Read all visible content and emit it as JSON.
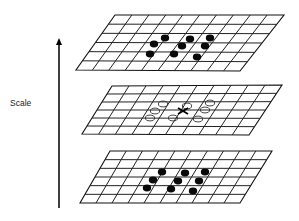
{
  "diagram": {
    "axis": {
      "label": "Scale",
      "direction": "up",
      "x": 59,
      "y_tail": 208,
      "y_tip": 38,
      "label_x": 10,
      "label_y": 106
    },
    "layers": [
      {
        "id": "upper-scale",
        "corners": {
          "tl": [
            115,
            15
          ],
          "tr": [
            284,
            15
          ],
          "br": [
            240,
            71
          ],
          "bl": [
            76,
            70
          ]
        },
        "rows": 6,
        "cols": 10,
        "marker_style": "filled",
        "markers": [
          [
            165,
            38
          ],
          [
            190,
            39
          ],
          [
            210,
            38
          ],
          [
            154,
            44
          ],
          [
            182,
            46
          ],
          [
            205,
            46
          ],
          [
            150,
            54
          ],
          [
            174,
            54
          ],
          [
            197,
            57
          ]
        ]
      },
      {
        "id": "current-scale",
        "corners": {
          "tl": [
            112,
            86
          ],
          "tr": [
            282,
            85
          ],
          "br": [
            249,
            135
          ],
          "bl": [
            82,
            134
          ]
        },
        "rows": 6,
        "cols": 10,
        "marker_style": "open",
        "markers": [
          [
            163,
            104
          ],
          [
            187,
            106
          ],
          [
            210,
            103
          ],
          [
            155,
            111
          ],
          [
            205,
            110
          ],
          [
            150,
            118
          ],
          [
            173,
            118
          ],
          [
            198,
            119
          ]
        ],
        "sample_point": [
          183,
          111
        ],
        "sample_symbol": "X"
      },
      {
        "id": "lower-scale",
        "corners": {
          "tl": [
            110,
            151
          ],
          "tr": [
            272,
            151
          ],
          "br": [
            240,
            203
          ],
          "bl": [
            80,
            203
          ]
        },
        "rows": 6,
        "cols": 10,
        "marker_style": "filled",
        "markers": [
          [
            162,
            172
          ],
          [
            185,
            173
          ],
          [
            205,
            172
          ],
          [
            153,
            180
          ],
          [
            178,
            181
          ],
          [
            199,
            181
          ],
          [
            147,
            188
          ],
          [
            171,
            189
          ],
          [
            193,
            191
          ]
        ]
      }
    ]
  }
}
